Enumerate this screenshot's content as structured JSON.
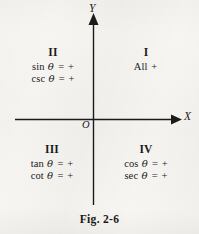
{
  "figure": {
    "caption": "Fig. 2-6",
    "axes": {
      "x_label": "X",
      "y_label": "Y",
      "origin_label": "O"
    },
    "quadrants": [
      {
        "id": "quadrant-1",
        "roman": "I",
        "lines": [
          {
            "func": "All",
            "theta": "",
            "eq": "+"
          }
        ],
        "text_lines": [
          "All +"
        ]
      },
      {
        "id": "quadrant-2",
        "roman": "II",
        "lines": [
          {
            "func": "sin",
            "theta": "θ",
            "eq": "=",
            "sign": "+"
          },
          {
            "func": "csc",
            "theta": "θ",
            "eq": "=",
            "sign": "+"
          }
        ]
      },
      {
        "id": "quadrant-3",
        "roman": "III",
        "lines": [
          {
            "func": "tan",
            "theta": "θ",
            "eq": "=",
            "sign": "+"
          },
          {
            "func": "cot",
            "theta": "θ",
            "eq": "=",
            "sign": "+"
          }
        ]
      },
      {
        "id": "quadrant-4",
        "roman": "IV",
        "lines": [
          {
            "func": "cos",
            "theta": "θ",
            "eq": "=",
            "sign": "+"
          },
          {
            "func": "sec",
            "theta": "θ",
            "eq": "=",
            "sign": "+"
          }
        ]
      }
    ]
  },
  "colors": {
    "ink": "#1a1a1a",
    "paper": "#f6f5f2"
  }
}
